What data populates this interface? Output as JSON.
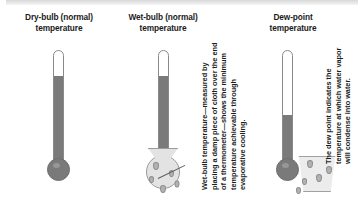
{
  "figure": {
    "background_color": "#ffffff",
    "accent_gray": "#7a7a7a",
    "columns": [
      {
        "id": "dry-bulb",
        "title": "Dry-bulb (normal)\ntemperature",
        "title_line1": "Dry-bulb (normal)",
        "title_line2": "temperature",
        "fill_percent": 78,
        "caption": "",
        "bulb_style": "plain"
      },
      {
        "id": "wet-bulb",
        "title": "Wet-bulb (normal)\ntemperature",
        "title_line1": "Wet-bulb (normal)",
        "title_line2": "temperature",
        "fill_percent": 78,
        "caption": "Wet-bulb temperature—measured by placing a damp piece of cloth over the end of a thermometer—shows the minimum temperature achievable through evaporative cooling.",
        "bulb_style": "cloth-wrapped"
      },
      {
        "id": "dew-point",
        "title": "Dew-point\ntemperature",
        "title_line1": "Dew-point",
        "title_line2": "temperature",
        "fill_percent": 44,
        "caption": "The dew point indicates the temperature at which water vapor will condense into water.",
        "bulb_style": "plain"
      }
    ],
    "icons": {
      "droplet": "water-droplet",
      "glass": "condensation-glass",
      "cloth": "damp-cloth"
    }
  }
}
